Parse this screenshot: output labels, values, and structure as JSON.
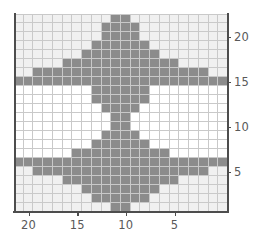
{
  "chart_data": {
    "type": "heatmap",
    "title": "",
    "xlabel": "",
    "ylabel": "",
    "grid": true,
    "legend": false,
    "x_axis_reversed": true,
    "ncols": 22,
    "nrows": 22,
    "xlim": [
      21.5,
      -0.5
    ],
    "ylim": [
      0.5,
      22.5
    ],
    "x_ticks": [
      20,
      15,
      10,
      5
    ],
    "x_tick_labels": [
      "20",
      "15",
      "10",
      "5"
    ],
    "y_ticks": [
      20,
      15,
      10,
      5
    ],
    "y_tick_labels": [
      "20",
      "15",
      "10",
      "5"
    ],
    "value_levels": [
      0,
      1,
      2
    ],
    "colors": {
      "level_0": "#ffffff",
      "level_1": "#f0f0f0",
      "level_2": "#8c8c8c",
      "gridline": "#c9c9c9",
      "axis": "#4d4d4d",
      "tick_label": "#595959",
      "background": "#ffffff"
    },
    "x_values": [
      21,
      20,
      19,
      18,
      17,
      16,
      15,
      14,
      13,
      12,
      11,
      10,
      9,
      8,
      7,
      6,
      5,
      4,
      3,
      2,
      1,
      0
    ],
    "y_values": [
      22,
      21,
      20,
      19,
      18,
      17,
      16,
      15,
      14,
      13,
      12,
      11,
      10,
      9,
      8,
      7,
      6,
      5,
      4,
      3,
      2,
      1
    ],
    "values": [
      [
        1,
        1,
        1,
        1,
        1,
        1,
        1,
        1,
        1,
        1,
        2,
        2,
        1,
        1,
        1,
        1,
        1,
        1,
        1,
        1,
        1,
        1
      ],
      [
        1,
        1,
        1,
        1,
        1,
        1,
        1,
        1,
        1,
        2,
        2,
        2,
        2,
        1,
        1,
        1,
        1,
        1,
        1,
        1,
        1,
        1
      ],
      [
        1,
        1,
        1,
        1,
        1,
        1,
        1,
        1,
        1,
        2,
        2,
        2,
        2,
        1,
        1,
        1,
        1,
        1,
        1,
        1,
        1,
        1
      ],
      [
        1,
        1,
        1,
        1,
        1,
        1,
        1,
        1,
        2,
        2,
        2,
        2,
        2,
        2,
        1,
        1,
        1,
        1,
        1,
        1,
        1,
        1
      ],
      [
        1,
        1,
        1,
        1,
        1,
        1,
        1,
        2,
        2,
        2,
        2,
        2,
        2,
        2,
        2,
        1,
        1,
        1,
        1,
        1,
        1,
        1
      ],
      [
        1,
        1,
        1,
        1,
        1,
        2,
        2,
        2,
        2,
        2,
        2,
        2,
        2,
        2,
        2,
        2,
        2,
        1,
        1,
        1,
        1,
        1
      ],
      [
        1,
        1,
        2,
        2,
        2,
        2,
        2,
        2,
        2,
        2,
        2,
        2,
        2,
        2,
        2,
        2,
        2,
        2,
        2,
        2,
        1,
        1
      ],
      [
        2,
        2,
        2,
        2,
        2,
        2,
        2,
        2,
        2,
        2,
        2,
        2,
        2,
        2,
        2,
        2,
        2,
        2,
        2,
        2,
        2,
        2
      ],
      [
        0,
        0,
        0,
        0,
        0,
        0,
        0,
        0,
        2,
        2,
        2,
        2,
        2,
        2,
        0,
        0,
        0,
        0,
        0,
        0,
        0,
        0
      ],
      [
        0,
        0,
        0,
        0,
        0,
        0,
        0,
        0,
        2,
        2,
        2,
        2,
        2,
        2,
        0,
        0,
        0,
        0,
        0,
        0,
        0,
        0
      ],
      [
        0,
        0,
        0,
        0,
        0,
        0,
        0,
        0,
        0,
        2,
        2,
        2,
        2,
        0,
        0,
        0,
        0,
        0,
        0,
        0,
        0,
        0
      ],
      [
        0,
        0,
        0,
        0,
        0,
        0,
        0,
        0,
        0,
        0,
        2,
        2,
        0,
        0,
        0,
        0,
        0,
        0,
        0,
        0,
        0,
        0
      ],
      [
        0,
        0,
        0,
        0,
        0,
        0,
        0,
        0,
        0,
        0,
        2,
        2,
        0,
        0,
        0,
        0,
        0,
        0,
        0,
        0,
        0,
        0
      ],
      [
        0,
        0,
        0,
        0,
        0,
        0,
        0,
        0,
        0,
        2,
        2,
        2,
        2,
        0,
        0,
        0,
        0,
        0,
        0,
        0,
        0,
        0
      ],
      [
        0,
        0,
        0,
        0,
        0,
        0,
        0,
        0,
        2,
        2,
        2,
        2,
        2,
        2,
        0,
        0,
        0,
        0,
        0,
        0,
        0,
        0
      ],
      [
        0,
        0,
        0,
        0,
        0,
        0,
        2,
        2,
        2,
        2,
        2,
        2,
        2,
        2,
        2,
        2,
        0,
        0,
        0,
        0,
        0,
        0
      ],
      [
        2,
        2,
        2,
        2,
        2,
        2,
        2,
        2,
        2,
        2,
        2,
        2,
        2,
        2,
        2,
        2,
        2,
        2,
        2,
        2,
        2,
        2
      ],
      [
        1,
        1,
        2,
        2,
        2,
        2,
        2,
        2,
        2,
        2,
        2,
        2,
        2,
        2,
        2,
        2,
        2,
        2,
        2,
        2,
        1,
        1
      ],
      [
        1,
        1,
        1,
        1,
        1,
        2,
        2,
        2,
        2,
        2,
        2,
        2,
        2,
        2,
        2,
        2,
        2,
        1,
        1,
        1,
        1,
        1
      ],
      [
        1,
        1,
        1,
        1,
        1,
        1,
        1,
        2,
        2,
        2,
        2,
        2,
        2,
        2,
        2,
        1,
        1,
        1,
        1,
        1,
        1,
        1
      ],
      [
        1,
        1,
        1,
        1,
        1,
        1,
        1,
        1,
        2,
        2,
        2,
        2,
        2,
        2,
        1,
        1,
        1,
        1,
        1,
        1,
        1,
        1
      ],
      [
        1,
        1,
        1,
        1,
        1,
        1,
        1,
        1,
        1,
        1,
        2,
        2,
        1,
        1,
        1,
        1,
        1,
        1,
        1,
        1,
        1,
        1
      ]
    ]
  }
}
